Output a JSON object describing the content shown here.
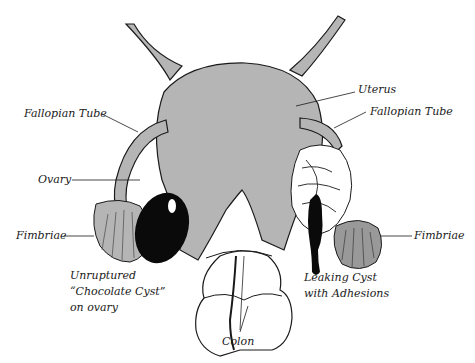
{
  "diagram": {
    "colors": {
      "tissue_fill": "#b5b5b5",
      "outline": "#1a1a1a",
      "cyst": "#0a0a0a",
      "background": "#ffffff"
    },
    "labels": {
      "uterus": "Uterus",
      "fallopian_tube_left": "Fallopian Tube",
      "fallopian_tube_right": "Fallopian Tube",
      "ovary": "Ovary",
      "fimbriae_left": "Fimbriae",
      "fimbriae_right": "Fimbriae",
      "chocolate_cyst_line1": "Unruptured",
      "chocolate_cyst_line2": "“Chocolate Cyst”",
      "chocolate_cyst_line3": "on ovary",
      "leaking_cyst_line1": "Leaking Cyst",
      "leaking_cyst_line2": "with Adhesions",
      "colon": "Colon"
    }
  }
}
